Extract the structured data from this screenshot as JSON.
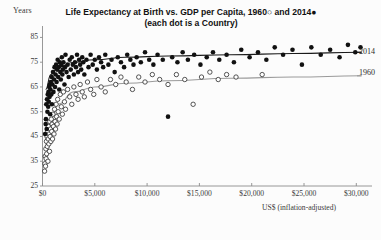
{
  "chart_data": {
    "type": "scatter",
    "title": "Life Expectancy at Birth vs. GDP per Capita, 1960○ and 2014●",
    "subtitle": "(each dot is a Country)",
    "xlabel": "US$ (inflation-adjusted)",
    "ylabel": "Years",
    "xlim": [
      0,
      31500
    ],
    "ylim": [
      25,
      88
    ],
    "xticks": [
      0,
      5000,
      10000,
      15000,
      20000,
      25000,
      30000
    ],
    "xticklabels": [
      "$0",
      "$5,000",
      "$10,000",
      "$15,000",
      "$20,000",
      "$25,000",
      "$30,000"
    ],
    "yticks": [
      25,
      35,
      45,
      55,
      65,
      75,
      85
    ],
    "yticklabels": [
      "25",
      "35",
      "45",
      "55",
      "65",
      "75",
      "85"
    ],
    "grid": false,
    "legend_position": "right-inline",
    "colors": {
      "axis": "#8c8c8c",
      "text": "#2b2b2b",
      "series_2014": "#111111",
      "series_1960": "#ffffff",
      "series_1960_edge": "#2b2b2b",
      "trend_2014": "#1a1a1a",
      "trend_1960": "#9a9a9a",
      "background": "#fcfcfc"
    },
    "series": [
      {
        "name": "2014",
        "marker": "filled-circle",
        "label": "2014",
        "points": [
          [
            250,
            46
          ],
          [
            300,
            50
          ],
          [
            330,
            52
          ],
          [
            360,
            58
          ],
          [
            400,
            48
          ],
          [
            430,
            60
          ],
          [
            470,
            55
          ],
          [
            500,
            62
          ],
          [
            540,
            57
          ],
          [
            570,
            63
          ],
          [
            600,
            59
          ],
          [
            640,
            65
          ],
          [
            680,
            61
          ],
          [
            700,
            66
          ],
          [
            730,
            54
          ],
          [
            760,
            64
          ],
          [
            800,
            67
          ],
          [
            840,
            62
          ],
          [
            880,
            69
          ],
          [
            900,
            58
          ],
          [
            950,
            66
          ],
          [
            1000,
            71
          ],
          [
            1050,
            63
          ],
          [
            1100,
            68
          ],
          [
            1150,
            73
          ],
          [
            1200,
            65
          ],
          [
            1250,
            70
          ],
          [
            1300,
            74
          ],
          [
            1350,
            67
          ],
          [
            1400,
            72
          ],
          [
            1450,
            76
          ],
          [
            1500,
            69
          ],
          [
            1550,
            73
          ],
          [
            1600,
            64
          ],
          [
            1650,
            75
          ],
          [
            1700,
            71
          ],
          [
            1750,
            68
          ],
          [
            1800,
            74
          ],
          [
            1850,
            77
          ],
          [
            1900,
            70
          ],
          [
            1950,
            72
          ],
          [
            2000,
            75
          ],
          [
            2100,
            66
          ],
          [
            2150,
            73
          ],
          [
            2200,
            78
          ],
          [
            2300,
            71
          ],
          [
            2400,
            74
          ],
          [
            2500,
            69
          ],
          [
            2600,
            76
          ],
          [
            2700,
            72
          ],
          [
            2800,
            77
          ],
          [
            2900,
            74
          ],
          [
            3000,
            70
          ],
          [
            3100,
            75
          ],
          [
            3200,
            73
          ],
          [
            3300,
            78
          ],
          [
            3400,
            71
          ],
          [
            3500,
            76
          ],
          [
            3600,
            74
          ],
          [
            3700,
            72
          ],
          [
            3800,
            77
          ],
          [
            3900,
            75
          ],
          [
            4000,
            70
          ],
          [
            4200,
            76
          ],
          [
            4400,
            73
          ],
          [
            4600,
            78
          ],
          [
            4800,
            74
          ],
          [
            5000,
            76
          ],
          [
            5200,
            72
          ],
          [
            5400,
            77
          ],
          [
            5600,
            75
          ],
          [
            5800,
            73
          ],
          [
            6000,
            78
          ],
          [
            6300,
            74
          ],
          [
            6600,
            76
          ],
          [
            6900,
            71
          ],
          [
            7200,
            77
          ],
          [
            7500,
            75
          ],
          [
            7800,
            73
          ],
          [
            8100,
            78
          ],
          [
            8400,
            76
          ],
          [
            8700,
            74
          ],
          [
            9000,
            77
          ],
          [
            9400,
            75
          ],
          [
            9800,
            79
          ],
          [
            10200,
            76
          ],
          [
            10600,
            74
          ],
          [
            11000,
            78
          ],
          [
            11500,
            76
          ],
          [
            12000,
            53
          ],
          [
            12400,
            77
          ],
          [
            12900,
            75
          ],
          [
            13400,
            79
          ],
          [
            13900,
            76
          ],
          [
            14500,
            78
          ],
          [
            15100,
            74
          ],
          [
            15700,
            77
          ],
          [
            16300,
            79
          ],
          [
            16900,
            76
          ],
          [
            17600,
            78
          ],
          [
            18300,
            75
          ],
          [
            19000,
            80
          ],
          [
            19800,
            77
          ],
          [
            20600,
            79
          ],
          [
            21400,
            76
          ],
          [
            22200,
            81
          ],
          [
            23000,
            78
          ],
          [
            23900,
            80
          ],
          [
            24800,
            74
          ],
          [
            25700,
            81
          ],
          [
            26600,
            78
          ],
          [
            27500,
            80
          ],
          [
            28400,
            77
          ],
          [
            29200,
            82
          ],
          [
            29900,
            79
          ],
          [
            30400,
            81
          ]
        ]
      },
      {
        "name": "1960",
        "marker": "open-circle",
        "label": "1960",
        "points": [
          [
            200,
            31
          ],
          [
            230,
            34
          ],
          [
            260,
            37
          ],
          [
            290,
            33
          ],
          [
            320,
            40
          ],
          [
            350,
            36
          ],
          [
            380,
            43
          ],
          [
            400,
            38
          ],
          [
            430,
            45
          ],
          [
            460,
            41
          ],
          [
            490,
            47
          ],
          [
            520,
            35
          ],
          [
            550,
            44
          ],
          [
            580,
            49
          ],
          [
            610,
            42
          ],
          [
            640,
            46
          ],
          [
            670,
            39
          ],
          [
            700,
            51
          ],
          [
            730,
            45
          ],
          [
            760,
            48
          ],
          [
            800,
            43
          ],
          [
            840,
            52
          ],
          [
            880,
            47
          ],
          [
            920,
            50
          ],
          [
            960,
            44
          ],
          [
            1000,
            54
          ],
          [
            1050,
            49
          ],
          [
            1100,
            46
          ],
          [
            1150,
            56
          ],
          [
            1200,
            51
          ],
          [
            1250,
            48
          ],
          [
            1300,
            58
          ],
          [
            1350,
            53
          ],
          [
            1400,
            50
          ],
          [
            1450,
            60
          ],
          [
            1500,
            55
          ],
          [
            1600,
            52
          ],
          [
            1700,
            62
          ],
          [
            1800,
            57
          ],
          [
            1900,
            54
          ],
          [
            2000,
            63
          ],
          [
            2100,
            59
          ],
          [
            2200,
            56
          ],
          [
            2400,
            64
          ],
          [
            2600,
            61
          ],
          [
            2800,
            58
          ],
          [
            3000,
            65
          ],
          [
            3200,
            62
          ],
          [
            3400,
            60
          ],
          [
            3600,
            66
          ],
          [
            3800,
            63
          ],
          [
            4000,
            61
          ],
          [
            4300,
            67
          ],
          [
            4600,
            64
          ],
          [
            4900,
            62
          ],
          [
            5200,
            68
          ],
          [
            5600,
            65
          ],
          [
            6000,
            63
          ],
          [
            6500,
            68
          ],
          [
            7000,
            66
          ],
          [
            7500,
            69
          ],
          [
            8000,
            67
          ],
          [
            8600,
            64
          ],
          [
            9200,
            69
          ],
          [
            9800,
            67
          ],
          [
            10500,
            70
          ],
          [
            11200,
            68
          ],
          [
            12000,
            66
          ],
          [
            12800,
            70
          ],
          [
            13600,
            68
          ],
          [
            14400,
            58
          ],
          [
            15200,
            69
          ],
          [
            16000,
            71
          ],
          [
            16800,
            68
          ],
          [
            17600,
            70
          ],
          [
            18500,
            69
          ],
          [
            21000,
            70
          ]
        ]
      }
    ],
    "trendlines": [
      {
        "name": "2014-trend",
        "label": "2014",
        "points": [
          [
            300,
            64
          ],
          [
            800,
            70
          ],
          [
            1500,
            73
          ],
          [
            3000,
            75
          ],
          [
            5000,
            76
          ],
          [
            8000,
            77
          ],
          [
            12000,
            77.5
          ],
          [
            18000,
            78
          ],
          [
            24000,
            78.5
          ],
          [
            30500,
            79
          ]
        ]
      },
      {
        "name": "1960-trend",
        "label": "1960",
        "points": [
          [
            300,
            44
          ],
          [
            800,
            52
          ],
          [
            1500,
            58
          ],
          [
            3000,
            63
          ],
          [
            5000,
            65
          ],
          [
            8000,
            66.5
          ],
          [
            12000,
            67.5
          ],
          [
            18000,
            68.5
          ],
          [
            24000,
            69
          ],
          [
            30500,
            69.5
          ]
        ]
      }
    ]
  }
}
